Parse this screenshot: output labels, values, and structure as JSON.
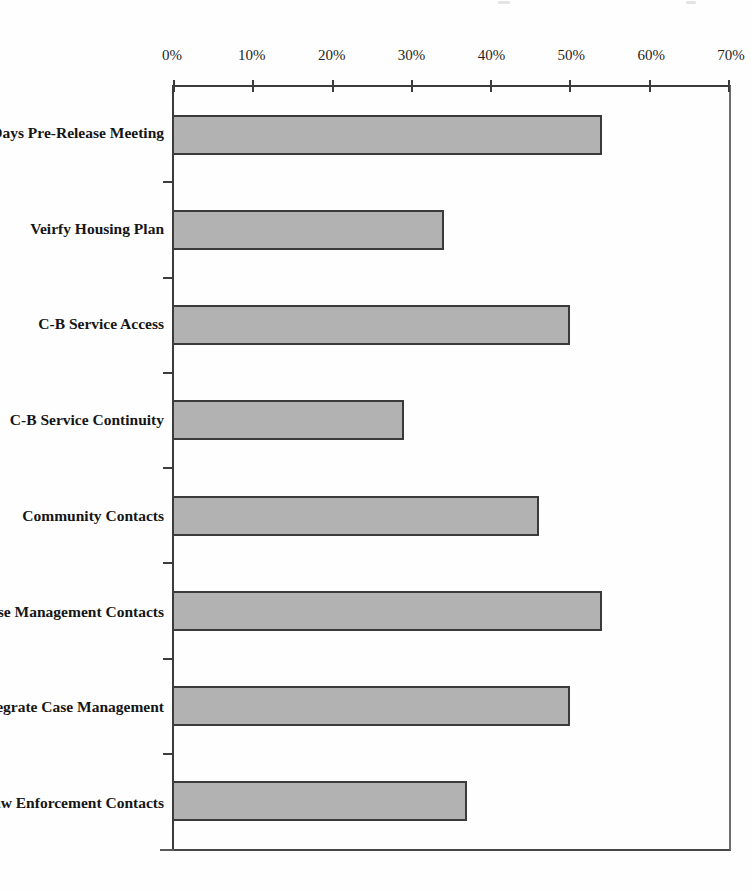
{
  "chart_data": {
    "type": "bar",
    "orientation": "horizontal",
    "title": "",
    "categories": [
      "60 Days Pre-Release Meeting",
      "Veirfy Housing Plan",
      "C-B Service Access",
      "C-B Service Continuity",
      "Community Contacts",
      "3 Case Management Contacts",
      "Integrate Case Management",
      "Law Enforcement Contacts"
    ],
    "values": [
      54,
      34,
      50,
      29,
      46,
      54,
      50,
      37
    ],
    "value_unit": "%",
    "x_axis": {
      "position": "top",
      "min": 0,
      "max": 70,
      "tick_step": 10,
      "tick_labels": [
        "0%",
        "10%",
        "20%",
        "30%",
        "40%",
        "50%",
        "60%",
        "70%"
      ]
    },
    "grid": false,
    "legend": false,
    "colors": {
      "bar_fill": "#b2b2b2",
      "bar_border": "#3a3a3a",
      "axis_line": "#3c3c3c",
      "text": "#1f1f1f",
      "background": "#fefefe"
    }
  }
}
